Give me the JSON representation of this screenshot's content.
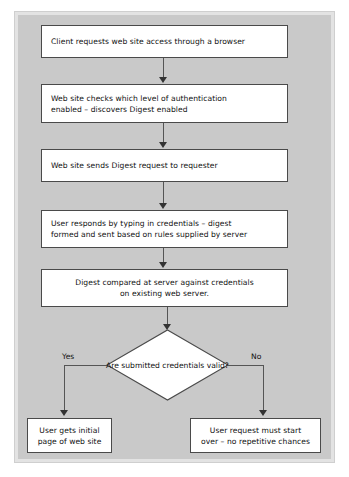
{
  "diagram": {
    "background_color": "#c9c9c9",
    "node_fill": "#ffffff",
    "node_stroke": "#4a4a4a",
    "connector_color": "#555555",
    "steps": [
      {
        "id": "step-1",
        "text": "Client requests web site access through a browser"
      },
      {
        "id": "step-2",
        "line1": "Web site checks which level of authentication",
        "line2": "enabled – discovers Digest enabled"
      },
      {
        "id": "step-3",
        "text": "Web site sends Digest request to requester"
      },
      {
        "id": "step-4",
        "line1": "User responds by typing in credentials – digest",
        "line2": "formed and sent based on rules supplied by server"
      },
      {
        "id": "step-5",
        "line1": "Digest compared at server against credentials",
        "line2": "on existing web server."
      }
    ],
    "decision": {
      "line1": "Are submitted",
      "line2": "credentials",
      "line3": "valid?"
    },
    "branches": {
      "yes_label": "Yes",
      "no_label": "No"
    },
    "outcomes": [
      {
        "id": "outcome-yes",
        "line1": "User gets initial",
        "line2": "page of web site"
      },
      {
        "id": "outcome-no",
        "line1": "User request must start",
        "line2": "over – no repetitive chances"
      }
    ]
  }
}
